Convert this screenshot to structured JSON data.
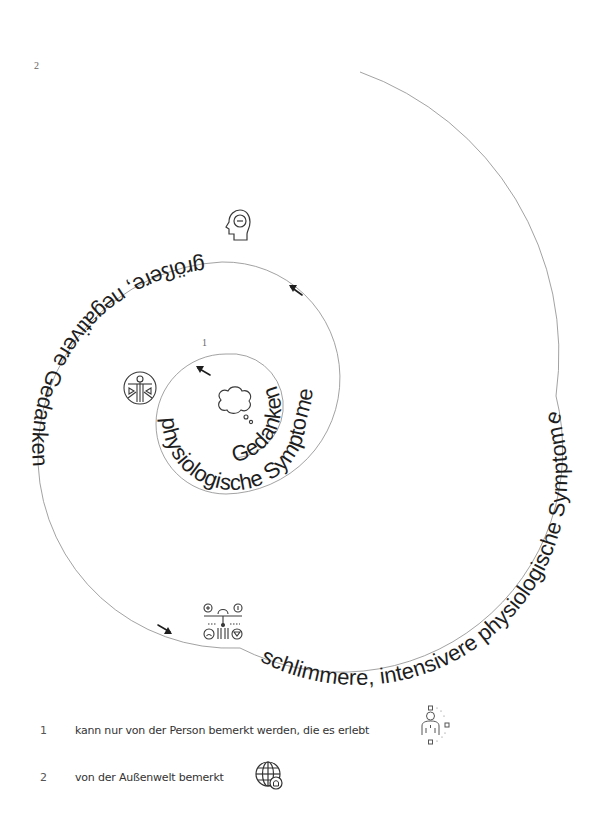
{
  "diagram": {
    "title": "",
    "markers": {
      "outer": "2",
      "inner": "1"
    },
    "spiral_segments": [
      {
        "id": "gedanken",
        "text": "Gedanken",
        "arrow": "←",
        "order": 1
      },
      {
        "id": "physiologische-symptome",
        "text": "physiologische Symptome",
        "arrow": "←",
        "order": 2
      },
      {
        "id": "groessere-negativere-gedanken",
        "text": "größere, negativere Gedanken",
        "arrow": "→",
        "order": 3
      },
      {
        "id": "schlimmere-intensivere-symptome",
        "text": "schlimmere, intensivere physiologische Symptome",
        "arrow": "",
        "order": 4
      }
    ],
    "icons": [
      {
        "name": "thought-cloud-icon",
        "meaning": "Gedanken"
      },
      {
        "name": "body-figure-icon",
        "meaning": "physiologische Symptome"
      },
      {
        "name": "head-minus-icon",
        "meaning": "negative Gedanken"
      },
      {
        "name": "symptoms-network-icon",
        "meaning": "intensivere Symptome"
      }
    ]
  },
  "legend": {
    "items": [
      {
        "number": "1",
        "text": "kann nur von der Person bemerkt werden, die es erlebt",
        "icon": "person-inner-icon"
      },
      {
        "number": "2",
        "text": "von der Außenwelt bemerkt",
        "icon": "globe-icon"
      }
    ]
  },
  "colors": {
    "text": "#1e1e1e",
    "line": "#8a8a8a",
    "icon": "#3a3a3a",
    "muted": "#666666"
  }
}
